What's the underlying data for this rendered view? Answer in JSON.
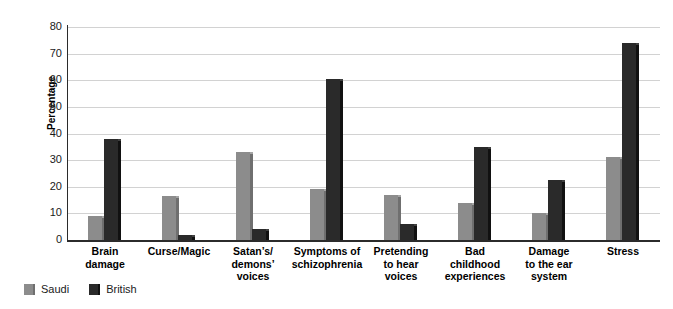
{
  "chart_data": {
    "type": "bar",
    "title": "",
    "subtitle": "",
    "xlabel": "",
    "ylabel": "Percentage",
    "ylim": [
      0,
      80
    ],
    "yticks": [
      0,
      10,
      20,
      30,
      40,
      50,
      60,
      70,
      80
    ],
    "grid": true,
    "legend_position": "bottom-left",
    "categories": [
      "Brain damage",
      "Curse/Magic",
      "Satan’s/demons’ voices",
      "Symptoms of schizophrenia",
      "Pretending to hear voices",
      "Bad childhood experiences",
      "Damage to the ear system",
      "Stress"
    ],
    "category_lines": [
      [
        "Brain",
        "damage"
      ],
      [
        "Curse/Magic"
      ],
      [
        "Satan’s/",
        "demons’",
        "voices"
      ],
      [
        "Symptoms of",
        "schizophrenia"
      ],
      [
        "Pretending",
        "to hear",
        "voices"
      ],
      [
        "Bad",
        "childhood",
        "experiences"
      ],
      [
        "Damage",
        "to the ear",
        "system"
      ],
      [
        "Stress"
      ]
    ],
    "series": [
      {
        "name": "Saudi",
        "color": "#8c8c8c",
        "values": [
          9,
          16.5,
          33,
          19,
          17,
          14,
          10,
          31
        ]
      },
      {
        "name": "British",
        "color": "#2a2a2a",
        "values": [
          38,
          2,
          4,
          60.5,
          6,
          35,
          22.5,
          74
        ]
      }
    ]
  },
  "legend": {
    "items": [
      {
        "label": "Saudi",
        "swatch": "saudi-swatch"
      },
      {
        "label": "British",
        "swatch": "british-swatch"
      }
    ]
  },
  "axis": {
    "y_title": "Percentage"
  }
}
